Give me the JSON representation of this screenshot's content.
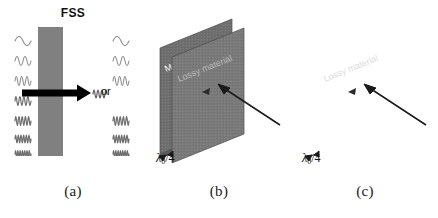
{
  "panel_a": {
    "caption": "(a)",
    "fss_label": "FSS",
    "or_label": "or",
    "bar_color": "#808080",
    "arrow_name": "transmission-arrow",
    "incident_waveforms": [
      {
        "cycles": 1,
        "label": "wave-1"
      },
      {
        "cycles": 2,
        "label": "wave-2"
      },
      {
        "cycles": 3,
        "label": "wave-3"
      },
      {
        "cycles": 4,
        "label": "wave-4"
      },
      {
        "cycles": 5,
        "label": "wave-5"
      },
      {
        "cycles": 6,
        "label": "wave-6"
      },
      {
        "cycles": 7,
        "label": "wave-7"
      }
    ],
    "transmitted_waveforms": [
      {
        "cycles": 1,
        "label": "wave-1"
      },
      {
        "cycles": 2,
        "label": "wave-2"
      },
      {
        "cycles": 3,
        "label": "wave-3"
      },
      {
        "cycles": 5,
        "label": "wave-5"
      },
      {
        "cycles": 6,
        "label": "wave-6"
      },
      {
        "cycles": 7,
        "label": "wave-7"
      }
    ],
    "arrow_waveform": {
      "cycles": 4,
      "label": "wave-4"
    }
  },
  "panel_b": {
    "caption": "(b)",
    "back_plane_label": "Metal ground plane",
    "front_plane_label": "Lossy material",
    "spacing_label": {
      "symbol": "λ",
      "subscript": "0",
      "divider": "/4",
      "full": "λ0/4"
    },
    "plane_color": "#7a7a7a",
    "back_plane_color": "#6f6f6f",
    "incident_arrow_name": "incident-wave-arrow"
  },
  "panel_c": {
    "caption": "(c)",
    "back_plane_label": "Metal ground plane",
    "front_plane_label": "Lossy material",
    "spacing_label": {
      "symbol": "λ",
      "subscript": "0",
      "divider": "/4",
      "full": "λ0/4"
    },
    "plane_color": "#7a7a7a",
    "back_plane_color": "#6f6f6f",
    "incident_arrow_name": "incident-wave-arrow",
    "fss_array": {
      "columns": 4,
      "rows": 5,
      "element_shape": "cross-dipole"
    }
  }
}
